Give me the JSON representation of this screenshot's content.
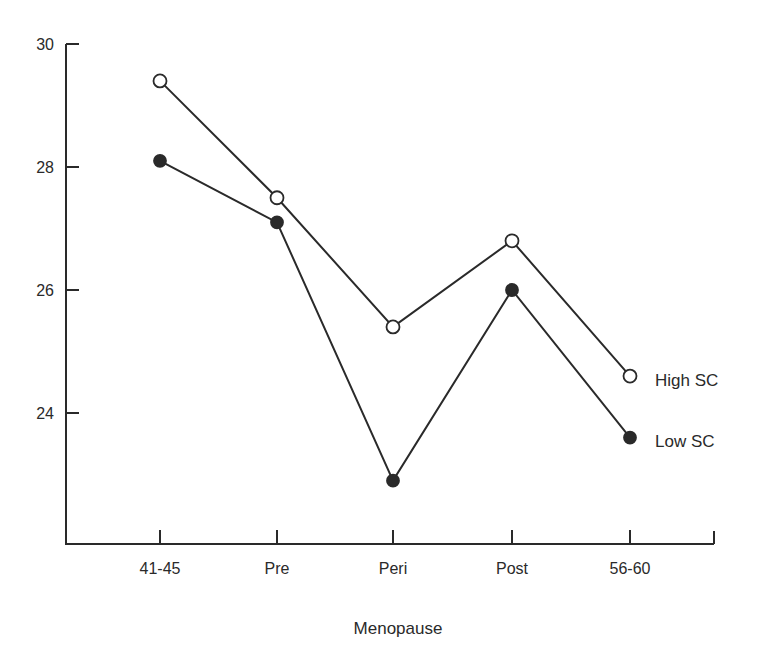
{
  "chart_data": {
    "type": "line",
    "title": "",
    "xlabel": "Menopause",
    "ylabel": "",
    "categories": [
      "41-45",
      "Pre",
      "Peri",
      "Post",
      "56-60"
    ],
    "y_ticks": [
      30,
      28,
      26,
      24
    ],
    "ylim": [
      21.8,
      30
    ],
    "grid": false,
    "legend_position": "inline-right",
    "series": [
      {
        "name": "High SC",
        "marker": "open-circle",
        "values": [
          29.4,
          27.5,
          25.4,
          26.8,
          24.6
        ]
      },
      {
        "name": "Low SC",
        "marker": "filled-circle",
        "values": [
          28.1,
          27.1,
          22.9,
          26.0,
          23.6
        ]
      }
    ]
  },
  "colors": {
    "line": "#2a2a2a",
    "background": "#ffffff"
  }
}
